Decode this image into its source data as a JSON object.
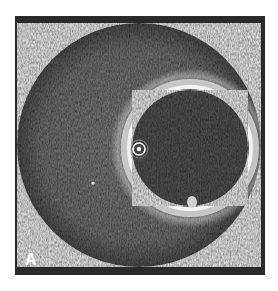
{
  "figure": {
    "panel_label": "A",
    "colors": {
      "background": "#2a2a2a",
      "vessel_field": "#7a7a7a",
      "lumen": "#5c5c5c",
      "ring": "#e8e8e8",
      "page": "#ffffff"
    }
  }
}
